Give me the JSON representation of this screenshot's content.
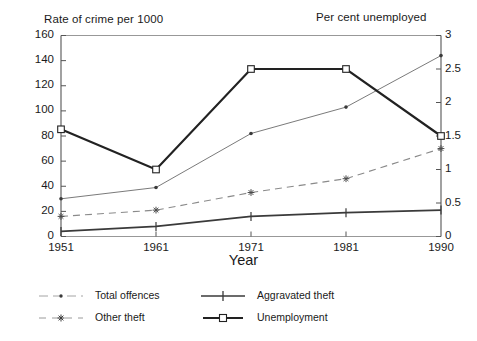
{
  "chart_data": {
    "type": "line",
    "title": "",
    "xlabel": "Year",
    "ylabel": "Rate of crime per 1000",
    "y2label": "Per cent unemployed",
    "x": [
      1951,
      1961,
      1971,
      1981,
      1990
    ],
    "categories": [
      "1951",
      "1961",
      "1971",
      "1981",
      "1990"
    ],
    "ylim": [
      0,
      160
    ],
    "yticks": [
      0,
      20,
      40,
      60,
      80,
      100,
      120,
      140,
      160
    ],
    "ytick_labels": [
      "0",
      "20",
      "40",
      "60",
      "80",
      "100",
      "120",
      "140",
      "160"
    ],
    "y2lim": [
      0,
      3
    ],
    "y2ticks": [
      0,
      0.5,
      1,
      1.5,
      2,
      2.5,
      3
    ],
    "y2tick_labels": [
      "0",
      "0.5",
      "1",
      "1.5",
      "2",
      "2.5",
      "3"
    ],
    "grid": false,
    "legend_position": "bottom",
    "series": [
      {
        "name": "Total offences",
        "axis": "left",
        "values": [
          30,
          39,
          82,
          103,
          144
        ],
        "color": "#6b6b6b",
        "line_style": "solid",
        "line_width": 0.9,
        "marker": "dot"
      },
      {
        "name": "Other theft",
        "axis": "left",
        "values": [
          16,
          21,
          35,
          46,
          70
        ],
        "color": "#8a8a8a",
        "line_style": "dashed",
        "line_width": 1.1,
        "marker": "asterisk"
      },
      {
        "name": "Aggravated theft",
        "axis": "left",
        "values": [
          4,
          8,
          16,
          19,
          21
        ],
        "color": "#3a3a3a",
        "line_style": "solid",
        "line_width": 1.7,
        "marker": "plus"
      },
      {
        "name": "Unemployment",
        "axis": "right",
        "values": [
          1.6,
          1.0,
          2.5,
          2.5,
          1.5
        ],
        "values_left_scale": [
          85,
          53,
          133,
          133,
          81
        ],
        "color": "#222222",
        "line_style": "solid",
        "line_width": 2.2,
        "marker": "square"
      }
    ]
  },
  "axis_titles": {
    "left": "Rate of crime per 1000",
    "right": "Per cent unemployed",
    "bottom": "Year"
  },
  "legend": {
    "items": [
      {
        "label": "Total offences",
        "marker": "dot-line-icon"
      },
      {
        "label": "Other theft",
        "marker": "asterisk-dashed-line-icon"
      },
      {
        "label": "Aggravated theft",
        "marker": "plus-solid-line-icon"
      },
      {
        "label": "Unemployment",
        "marker": "square-solid-line-icon"
      }
    ]
  },
  "colors": {
    "axis": "#555555",
    "text": "#1a1a1a",
    "total_offences": "#6b6b6b",
    "other_theft": "#8a8a8a",
    "aggravated_theft": "#3a3a3a",
    "unemployment": "#222222"
  }
}
